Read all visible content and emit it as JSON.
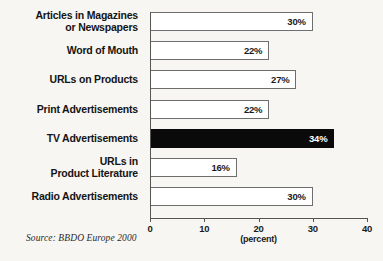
{
  "chart_data": {
    "type": "bar",
    "orientation": "horizontal",
    "title": "",
    "subtitle": "",
    "xlabel": "(percent)",
    "ylabel": "",
    "xlim": [
      0,
      40
    ],
    "xticks": [
      0,
      10,
      20,
      30,
      40
    ],
    "xtick_labels": [
      "0",
      "10",
      "20",
      "30",
      "40"
    ],
    "grid": false,
    "legend": null,
    "source_note": "Source: BBDO Europe 2000",
    "unit_suffix": "%",
    "highlight_category": "TV Advertisements",
    "colors": {
      "bar_fill": "#ffffff",
      "bar_border": "#6e6e6e",
      "highlight_fill": "#0a0a0a",
      "highlight_text": "#ffffff",
      "text": "#141414",
      "axis": "#555555",
      "background": "#f7f6f3"
    },
    "categories": [
      "Articles in Magazines\nor Newspapers",
      "Word of Mouth",
      "URLs on Products",
      "Print Advertisements",
      "TV Advertisements",
      "URLs in\nProduct Literature",
      "Radio Advertisements"
    ],
    "values": [
      30,
      22,
      27,
      22,
      34,
      16,
      30
    ],
    "value_labels": [
      "30%",
      "22%",
      "27%",
      "22%",
      "34%",
      "16%",
      "30%"
    ],
    "bars": [
      {
        "label": "Articles in Magazines\nor Newspapers",
        "value": 30,
        "value_label": "30%",
        "highlighted": false
      },
      {
        "label": "Word of Mouth",
        "value": 22,
        "value_label": "22%",
        "highlighted": false
      },
      {
        "label": "URLs on Products",
        "value": 27,
        "value_label": "27%",
        "highlighted": false
      },
      {
        "label": "Print Advertisements",
        "value": 22,
        "value_label": "22%",
        "highlighted": false
      },
      {
        "label": "TV Advertisements",
        "value": 34,
        "value_label": "34%",
        "highlighted": true
      },
      {
        "label": "URLs in\nProduct Literature",
        "value": 16,
        "value_label": "16%",
        "highlighted": false
      },
      {
        "label": "Radio Advertisements",
        "value": 30,
        "value_label": "30%",
        "highlighted": false
      }
    ]
  }
}
